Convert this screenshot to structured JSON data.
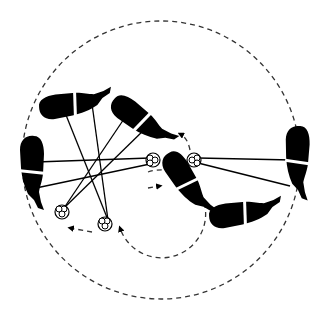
{
  "diagram": {
    "type": "motion-trajectory-illustration",
    "colors": {
      "ink": "#000000",
      "background": "#ffffff",
      "dash": "#333333"
    },
    "outer_trajectory": {
      "cx": 161,
      "cy": 160,
      "r": 139,
      "style": "dashed"
    },
    "inner_trajectory": {
      "cx": 104,
      "cy": 192,
      "r": 44,
      "style": "dashed",
      "arrows": "clockwise"
    },
    "pivots": [
      {
        "id": "pivot-a",
        "x": 153,
        "y": 160
      },
      {
        "id": "pivot-b",
        "x": 194,
        "y": 160
      },
      {
        "id": "pivot-c",
        "x": 62,
        "y": 212
      },
      {
        "id": "pivot-d",
        "x": 105,
        "y": 224
      }
    ],
    "bodies": [
      {
        "id": "body-left",
        "x": 32,
        "y": 172,
        "angle": 90
      },
      {
        "id": "body-top-left",
        "x": 75,
        "y": 104,
        "angle": -8
      },
      {
        "id": "body-top-center",
        "x": 142,
        "y": 122,
        "angle": 55
      },
      {
        "id": "body-center",
        "x": 188,
        "y": 185,
        "angle": 55
      },
      {
        "id": "body-bottom-right",
        "x": 245,
        "y": 213,
        "angle": -8
      },
      {
        "id": "body-right",
        "x": 296,
        "y": 162,
        "angle": 92
      }
    ]
  }
}
